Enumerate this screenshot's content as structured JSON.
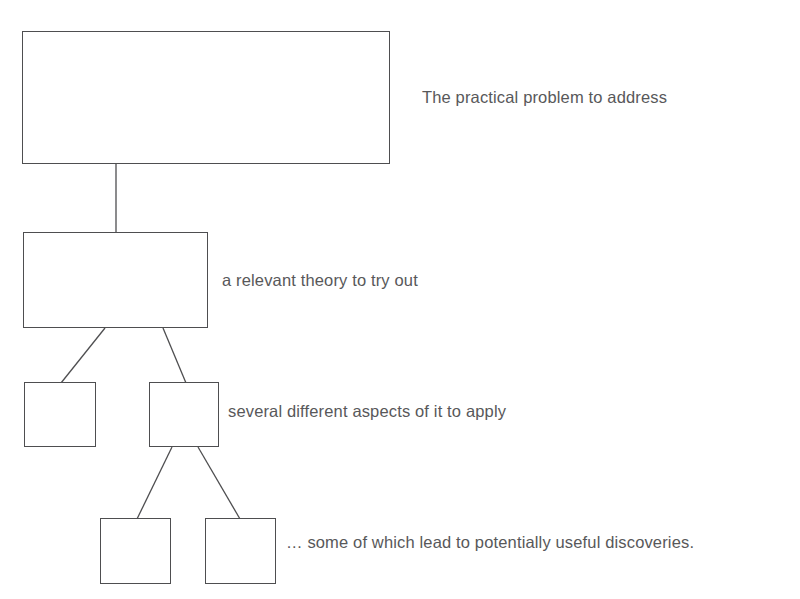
{
  "page": {
    "clipped_header_text": "",
    "background_color": "#ffffff",
    "line_color": "#4e4e50",
    "text_color": "#58585a"
  },
  "diagram": {
    "type": "hierarchy-tree",
    "title": "",
    "nodes": [
      {
        "id": "root",
        "label": "",
        "level": 1,
        "x": 22,
        "y": 31,
        "width": 368,
        "height": 133
      },
      {
        "id": "theory",
        "label": "",
        "level": 2,
        "x": 23,
        "y": 232,
        "width": 185,
        "height": 96
      },
      {
        "id": "aspect-1",
        "label": "",
        "level": 3,
        "x": 24,
        "y": 382,
        "width": 72,
        "height": 65
      },
      {
        "id": "aspect-2",
        "label": "",
        "level": 3,
        "x": 149,
        "y": 382,
        "width": 70,
        "height": 65
      },
      {
        "id": "discovery-1",
        "label": "",
        "level": 4,
        "x": 100,
        "y": 518,
        "width": 71,
        "height": 66
      },
      {
        "id": "discovery-2",
        "label": "",
        "level": 4,
        "x": 205,
        "y": 518,
        "width": 71,
        "height": 66
      }
    ],
    "edges": [
      {
        "from": "root",
        "to": "theory",
        "x1": 116,
        "y1": 164,
        "x2": 116,
        "y2": 232
      },
      {
        "from": "theory",
        "to": "aspect-1",
        "x1": 105,
        "y1": 328,
        "x2": 61,
        "y2": 382
      },
      {
        "from": "theory",
        "to": "aspect-2",
        "x1": 163,
        "y1": 328,
        "x2": 186,
        "y2": 382
      },
      {
        "from": "aspect-2",
        "to": "discovery-1",
        "x1": 172,
        "y1": 447,
        "x2": 137,
        "y2": 518
      },
      {
        "from": "aspect-2",
        "to": "discovery-2",
        "x1": 198,
        "y1": 447,
        "x2": 240,
        "y2": 518
      }
    ],
    "annotations": {
      "root": "The practical problem to address",
      "theory": "a relevant theory to try out",
      "aspects": "several different aspects of it to apply",
      "discoveries": "…  some of which lead to potentially useful discoveries."
    }
  }
}
